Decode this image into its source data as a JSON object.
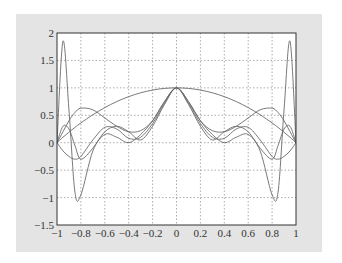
{
  "chart_data": {
    "type": "line",
    "title": "",
    "xlabel": "",
    "ylabel": "",
    "xlim": [
      -1,
      1
    ],
    "ylim": [
      -1.5,
      2
    ],
    "grid": true,
    "legend": null,
    "x_ticks": [
      "-1",
      "-0.8",
      "-0.6",
      "-0.4",
      "-0.2",
      "0",
      "0.2",
      "0.4",
      "0.6",
      "0.8",
      "1"
    ],
    "y_ticks": [
      "-1.5",
      "-1",
      "-0.5",
      "0",
      "0.5",
      "1",
      "1.5",
      "2"
    ],
    "x": [
      -1,
      -0.95,
      -0.9,
      -0.85,
      -0.8,
      -0.7,
      -0.6,
      -0.5,
      -0.4,
      -0.3,
      -0.2,
      -0.1,
      0,
      0.1,
      0.2,
      0.3,
      0.4,
      0.5,
      0.6,
      0.7,
      0.8,
      0.85,
      0.9,
      0.95,
      1
    ],
    "series": [
      {
        "name": "curve-1",
        "values": [
          0,
          0.1,
          0.19,
          0.28,
          0.36,
          0.51,
          0.64,
          0.75,
          0.84,
          0.91,
          0.96,
          0.99,
          1,
          0.99,
          0.96,
          0.91,
          0.84,
          0.75,
          0.64,
          0.51,
          0.36,
          0.28,
          0.19,
          0.1,
          0
        ]
      },
      {
        "name": "curve-2",
        "values": [
          0,
          0.2,
          0.4,
          0.55,
          0.63,
          0.6,
          0.45,
          0.3,
          0.2,
          0.22,
          0.4,
          0.75,
          1,
          0.75,
          0.4,
          0.22,
          0.2,
          0.3,
          0.45,
          0.6,
          0.63,
          0.55,
          0.4,
          0.2,
          0
        ]
      },
      {
        "name": "curve-3",
        "values": [
          0,
          -0.15,
          -0.25,
          -0.3,
          -0.25,
          0.05,
          0.28,
          0.25,
          0.08,
          0.1,
          0.35,
          0.72,
          1,
          0.72,
          0.35,
          0.1,
          0.08,
          0.25,
          0.28,
          0.05,
          -0.25,
          -0.3,
          -0.25,
          -0.15,
          0
        ]
      },
      {
        "name": "curve-4",
        "values": [
          0,
          0.3,
          0.25,
          -0.05,
          -0.3,
          -0.1,
          0.2,
          0.3,
          0.2,
          0.05,
          0.3,
          0.7,
          1,
          0.7,
          0.3,
          0.05,
          0.2,
          0.3,
          0.2,
          -0.1,
          -0.3,
          -0.05,
          0.25,
          0.3,
          0
        ]
      },
      {
        "name": "curve-5",
        "values": [
          0,
          1.85,
          0.6,
          -0.9,
          -0.95,
          -0.15,
          0.15,
          0.1,
          0.0,
          0.15,
          0.4,
          0.75,
          1,
          0.75,
          0.4,
          0.15,
          0.0,
          0.1,
          0.15,
          -0.15,
          -0.95,
          -0.9,
          0.6,
          1.85,
          0
        ]
      }
    ]
  },
  "colors": {
    "frame": "#e4e4e4",
    "plot_bg": "#ffffff",
    "axis": "#333333",
    "grid": "#888888",
    "line": "#6a6a6a"
  }
}
